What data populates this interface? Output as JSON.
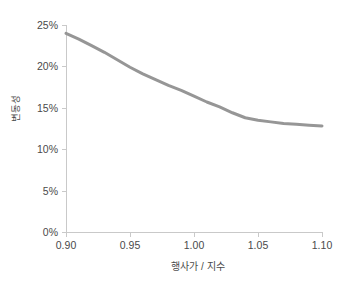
{
  "chart_data": {
    "type": "line",
    "title": "",
    "xlabel": "행사가 / 지수",
    "ylabel": "변동성",
    "xlim": [
      0.9,
      1.1
    ],
    "ylim": [
      0,
      25
    ],
    "grid": false,
    "legend": null,
    "x_ticks": [
      "0.90",
      "0.95",
      "1.00",
      "1.05",
      "1.10"
    ],
    "x_tick_values": [
      0.9,
      0.95,
      1.0,
      1.05,
      1.1
    ],
    "y_ticks": [
      "0%",
      "5%",
      "10%",
      "15%",
      "20%",
      "25%"
    ],
    "y_tick_values": [
      0,
      5,
      10,
      15,
      20,
      25
    ],
    "y_unit": "%",
    "series": [
      {
        "name": "변동성",
        "color": "#969696",
        "line_width": 3,
        "x": [
          0.9,
          0.91,
          0.92,
          0.93,
          0.94,
          0.95,
          0.96,
          0.97,
          0.98,
          0.99,
          1.0,
          1.01,
          1.02,
          1.03,
          1.04,
          1.05,
          1.06,
          1.07,
          1.08,
          1.09,
          1.1
        ],
        "values": [
          24.0,
          23.3,
          22.5,
          21.7,
          20.8,
          19.9,
          19.1,
          18.4,
          17.7,
          17.1,
          16.4,
          15.7,
          15.1,
          14.4,
          13.8,
          13.5,
          13.3,
          13.1,
          13.0,
          12.9,
          12.8
        ]
      }
    ]
  },
  "axes": {
    "axis_color": "#c9c9c9",
    "tick_label_color": "#4a4a4a"
  }
}
